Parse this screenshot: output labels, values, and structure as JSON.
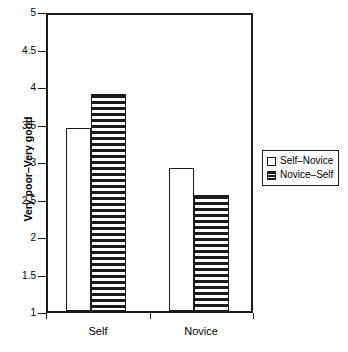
{
  "chart_data": {
    "type": "bar",
    "title": "",
    "xlabel": "",
    "ylabel": "Very poor–Very good",
    "ylim": [
      1,
      5
    ],
    "ytick_step": 0.5,
    "yticks": [
      "5",
      "4.5",
      "4",
      "3.5",
      "3",
      "2.5",
      "2",
      "1.5",
      "1"
    ],
    "ytick_values": [
      5,
      4.5,
      4,
      3.5,
      3,
      2.5,
      2,
      1.5,
      1
    ],
    "grid": false,
    "categories": [
      "Self",
      "Novice"
    ],
    "legend_position": "right-outside",
    "series": [
      {
        "name": "Self–Novice",
        "fill": "open",
        "values": [
          3.47,
          2.93
        ]
      },
      {
        "name": "Novice–Self",
        "fill": "horizontal-stripes",
        "values": [
          3.93,
          2.57
        ]
      }
    ],
    "colors": {
      "axis": "#1a1a1a",
      "bar_outline": "#1a1a1a",
      "bar_open_fill": "#ffffff",
      "bar_stripe": "#1a1a1a",
      "background": "#ffffff"
    }
  },
  "axis": {
    "y_title": "Very poor–Very good",
    "y_ticks": [
      {
        "label": "5",
        "value": 5
      },
      {
        "label": "4.5",
        "value": 4.5
      },
      {
        "label": "4",
        "value": 4
      },
      {
        "label": "3.5",
        "value": 3.5
      },
      {
        "label": "3",
        "value": 3
      },
      {
        "label": "2.5",
        "value": 2.5
      },
      {
        "label": "2",
        "value": 2
      },
      {
        "label": "1.5",
        "value": 1.5
      },
      {
        "label": "1",
        "value": 1
      }
    ],
    "x_categories": [
      {
        "label": "Self"
      },
      {
        "label": "Novice"
      }
    ]
  },
  "legend": {
    "entries": [
      {
        "label": "Self–Novice",
        "fill": "open"
      },
      {
        "label": "Novice–Self",
        "fill": "striped"
      }
    ]
  }
}
